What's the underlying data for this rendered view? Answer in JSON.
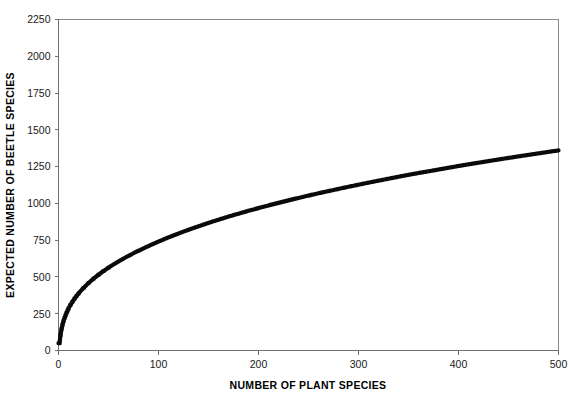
{
  "chart_data": {
    "type": "line",
    "title": "",
    "subtitle": "",
    "xlabel": "NUMBER OF PLANT SPECIES",
    "ylabel": "EXPECTED NUMBER OF BEETLE SPECIES",
    "xlim": [
      0,
      500
    ],
    "ylim": [
      0,
      2250
    ],
    "xticks": [
      0,
      100,
      200,
      300,
      400,
      500
    ],
    "yticks": [
      0,
      250,
      500,
      750,
      1000,
      1250,
      1500,
      1750,
      2000,
      2250
    ],
    "xtick_labels": [
      "0",
      "100",
      "200",
      "300",
      "400",
      "500"
    ],
    "ytick_labels": [
      "0",
      "250",
      "500",
      "750",
      "1000",
      "1250",
      "1500",
      "1750",
      "2000",
      "2250"
    ],
    "grid": false,
    "legend": false,
    "legend_position": "none",
    "marker": "square",
    "marker_color": "#0a0a0a",
    "line_color": "#0a0a0a",
    "series": [
      {
        "name": "Expected beetle species accumulation",
        "x": [
          1,
          2,
          3,
          4,
          5,
          6,
          7,
          8,
          9,
          10,
          12,
          14,
          16,
          18,
          20,
          25,
          30,
          35,
          40,
          45,
          50,
          60,
          70,
          80,
          90,
          100,
          120,
          140,
          160,
          180,
          200,
          225,
          250,
          275,
          300,
          325,
          350,
          375,
          400,
          425,
          450,
          475,
          500
        ],
        "y": [
          50,
          105,
          145,
          175,
          200,
          220,
          238,
          255,
          270,
          285,
          310,
          332,
          352,
          370,
          387,
          425,
          458,
          488,
          515,
          540,
          563,
          605,
          643,
          678,
          710,
          740,
          795,
          844,
          889,
          930,
          968,
          1012,
          1053,
          1091,
          1127,
          1161,
          1194,
          1224,
          1254,
          1282,
          1309,
          1335,
          1360
        ]
      }
    ],
    "annotations": []
  },
  "axes": {
    "x_title": "NUMBER OF PLANT SPECIES",
    "y_title": "EXPECTED NUMBER OF BEETLE SPECIES"
  },
  "colors": {
    "background": "#ffffff",
    "curve": "#0a0a0a",
    "axis": "#6f6f6f",
    "frame": "#8d8d8d",
    "text": "#1a1a1a"
  }
}
